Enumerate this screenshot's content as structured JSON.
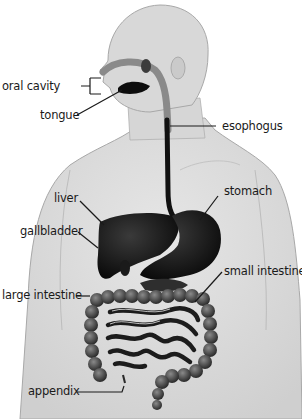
{
  "diagram": {
    "type": "anatomical-labeled-illustration",
    "labels": [
      {
        "id": "oral-cavity",
        "text": "oral cavity"
      },
      {
        "id": "tongue",
        "text": "tongue"
      },
      {
        "id": "esophogus",
        "text": "esophogus"
      },
      {
        "id": "liver",
        "text": "liver"
      },
      {
        "id": "stomach",
        "text": "stomach"
      },
      {
        "id": "gallbladder",
        "text": "gallbladder"
      },
      {
        "id": "small-intestine",
        "text": "small intestine"
      },
      {
        "id": "large-intestine",
        "text": "large intestine"
      },
      {
        "id": "appendix",
        "text": "appendix"
      }
    ],
    "colors": {
      "background": "#ffffff",
      "body": "#dcdcdc",
      "body_outline": "#a8a8a8",
      "organs": "#141414",
      "intestine": "#3a3a3a",
      "oral_tract": "#8a8a8a",
      "text": "#1a1a1a",
      "leader_lines": "#1a1a1a"
    }
  }
}
